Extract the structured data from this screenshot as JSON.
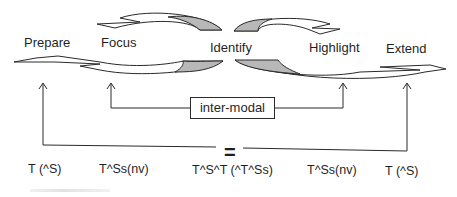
{
  "diagram": {
    "stages": [
      {
        "label": "Prepare",
        "code": "T (^S)"
      },
      {
        "label": "Focus",
        "code": "T^Ss(nv)"
      },
      {
        "label": "Identify",
        "code": "T^S^T (^T^Ss)"
      },
      {
        "label": "Highlight",
        "code": "T^Ss(nv)"
      },
      {
        "label": "Extend",
        "code": "T (^S)"
      }
    ],
    "inner_link_label": "inter-modal",
    "outer_link_label": "=",
    "colors": {
      "stroke": "#2a2a2a",
      "shaded_fill": "#b8b8b8",
      "background": "#ffffff"
    }
  }
}
